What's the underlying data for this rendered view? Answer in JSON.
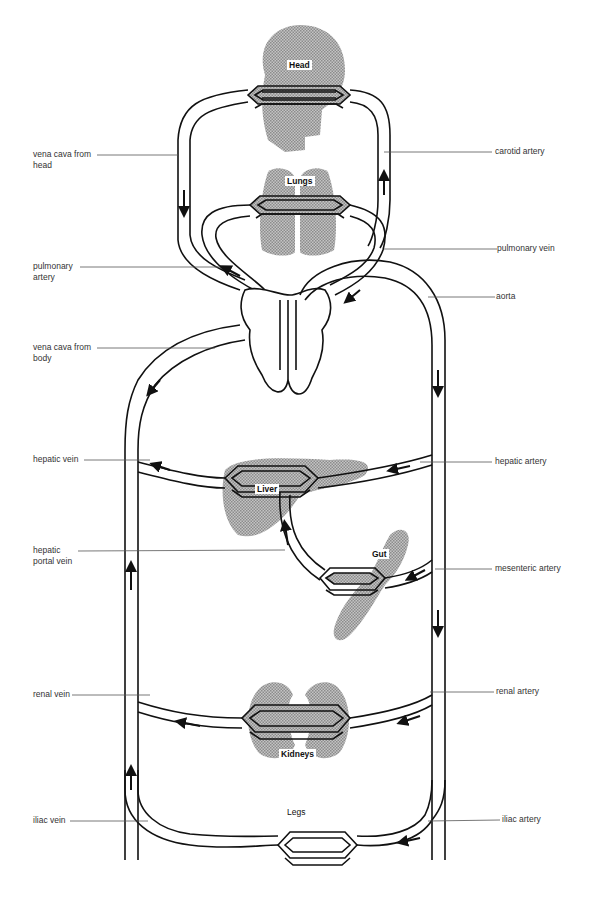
{
  "organs": {
    "head": "Head",
    "lungs": "Lungs",
    "liver": "Liver",
    "gut": "Gut",
    "kidneys": "Kidneys",
    "legs": "Legs"
  },
  "labels_left": {
    "vena_cava_head": "vena cava from\nhead",
    "pulmonary_artery": "pulmonary\nartery",
    "vena_cava_body": "vena cava from\nbody",
    "hepatic_vein": "hepatic vein",
    "hepatic_portal_vein": "hepatic\nportal vein",
    "renal_vein": "renal vein",
    "iliac_vein": "iliac vein"
  },
  "labels_right": {
    "carotid_artery": "carotid artery",
    "pulmonary_vein": "pulmonary vein",
    "aorta": "aorta",
    "hepatic_artery": "hepatic artery",
    "mesenteric_artery": "mesenteric artery",
    "renal_artery": "renal artery",
    "iliac_artery": "iliac artery"
  },
  "colors": {
    "vessel": "#111111",
    "organ_fill": "#a8a8a8",
    "leader": "#555555"
  }
}
